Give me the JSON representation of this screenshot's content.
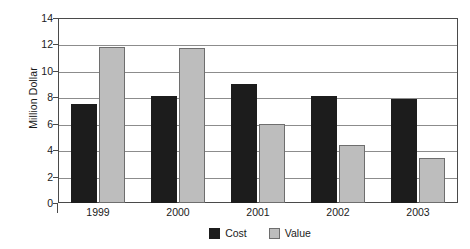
{
  "chart_data": {
    "type": "bar",
    "title": "",
    "xlabel": "",
    "ylabel": "Million Dollar",
    "categories": [
      "1999",
      "2000",
      "2001",
      "2002",
      "2003"
    ],
    "series": [
      {
        "name": "Cost",
        "color": "#1c1c1c",
        "values": [
          7.5,
          8.1,
          9.0,
          8.1,
          7.9
        ]
      },
      {
        "name": "Value",
        "color": "#bdbdbd",
        "values": [
          11.8,
          11.75,
          6.0,
          4.4,
          3.4
        ]
      }
    ],
    "ylim": [
      0,
      14
    ],
    "yticks": [
      0,
      2,
      4,
      6,
      8,
      10,
      12,
      14
    ],
    "ytick_labels": [
      "0",
      "2",
      "4",
      "6",
      "8",
      "10",
      "12",
      "14"
    ],
    "grid": "horizontal",
    "legend_position": "bottom-center"
  },
  "legend": {
    "items": [
      {
        "label": "Cost"
      },
      {
        "label": "Value"
      }
    ]
  }
}
